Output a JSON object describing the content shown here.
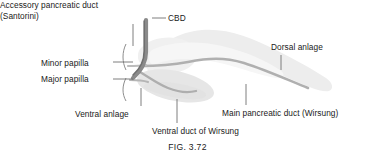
{
  "figure": {
    "caption": "FIG. 3.72",
    "labels": {
      "accessory_duct_line1": "Accessory pancreatic duct",
      "accessory_duct_line2": "(Santorini)",
      "cbd": "CBD",
      "minor_papilla": "Minor papilla",
      "major_papilla": "Major papilla",
      "ventral_anlage": "Ventral anlage",
      "ventral_duct_of_wirsung": "Ventral duct of Wirsung",
      "main_pancreatic_duct": "Main pancreatic duct (Wirsung)",
      "dorsal_anlage": "Dorsal anlage"
    }
  },
  "colors": {
    "background": "#ffffff",
    "text": "#1a1a1a",
    "leader_line": "#7a7a7a",
    "pancreas_fill": "#ededed",
    "pancreas_fill_light": "#f4f4f4",
    "duct_light": "#b9b9b9",
    "duct_medium": "#9a9a9a",
    "cbd_dark": "#7e7e7e",
    "bracket": "#8a8a8a"
  }
}
